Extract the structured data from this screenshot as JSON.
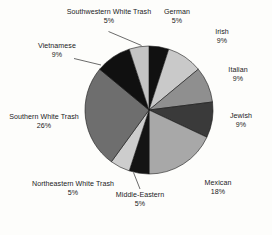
{
  "chart_data": {
    "type": "pie",
    "title": "",
    "subtitle": "",
    "xlabel": "",
    "ylabel": "",
    "legend": "none",
    "grid": false,
    "units": "percent",
    "total": 100,
    "start_angle_deg": 0,
    "direction": "clockwise",
    "categories": [
      "German",
      "Irish",
      "Italian",
      "Jewish",
      "Mexican",
      "Middle-Eastern",
      "Northeastern White Trash",
      "Southern White Trash",
      "Vietnamese",
      "Southwestern White Trash"
    ],
    "values": [
      5,
      9,
      9,
      9,
      18,
      5,
      5,
      26,
      9,
      5
    ],
    "slices": [
      {
        "label": "German",
        "value": 5,
        "percent_text": "5%",
        "color": "#111111"
      },
      {
        "label": "Irish",
        "value": 9,
        "percent_text": "9%",
        "color": "#c9c9c9"
      },
      {
        "label": "Italian",
        "value": 9,
        "percent_text": "9%",
        "color": "#8f8f8f"
      },
      {
        "label": "Jewish",
        "value": 9,
        "percent_text": "9%",
        "color": "#3a3a3a"
      },
      {
        "label": "Mexican",
        "value": 18,
        "percent_text": "18%",
        "color": "#a8a8a8"
      },
      {
        "label": "Middle-Eastern",
        "value": 5,
        "percent_text": "5%",
        "color": "#141414"
      },
      {
        "label": "Northeastern White Trash",
        "value": 5,
        "percent_text": "5%",
        "color": "#cdcdcd"
      },
      {
        "label": "Southern White Trash",
        "value": 26,
        "percent_text": "26%",
        "color": "#6e6e6e"
      },
      {
        "label": "Vietnamese",
        "value": 9,
        "percent_text": "9%",
        "color": "#101010"
      },
      {
        "label": "Southwestern White Trash",
        "value": 5,
        "percent_text": "5%",
        "color": "#c4c4c4"
      }
    ],
    "colors": {
      "background": "#fdfdfb",
      "outline": "#151515",
      "text": "#1b1b1b",
      "leader": "#2b2b2b"
    }
  },
  "labels": {
    "southwestern": {
      "name": "Southwestern White Trash",
      "pct": "5%"
    },
    "german": {
      "name": "German",
      "pct": "5%"
    },
    "irish": {
      "name": "Irish",
      "pct": "9%"
    },
    "italian": {
      "name": "Italian",
      "pct": "9%"
    },
    "jewish": {
      "name": "Jewish",
      "pct": "9%"
    },
    "mexican": {
      "name": "Mexican",
      "pct": "18%"
    },
    "middleeast": {
      "name": "Middle-Eastern",
      "pct": "5%"
    },
    "northeastern": {
      "name": "Northeastern White Trash",
      "pct": "5%"
    },
    "southern": {
      "name": "Southern White Trash",
      "pct": "26%"
    },
    "vietnamese": {
      "name": "Vietnamese",
      "pct": "9%"
    }
  }
}
